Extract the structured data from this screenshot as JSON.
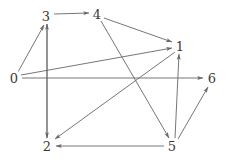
{
  "figure": {
    "kind": "directed-graph-diagram",
    "background_color": "#ffffff",
    "edge_color": "#666666",
    "label_color": "#3a3a3a",
    "edge_width": 0.9,
    "width": 226,
    "height": 160
  },
  "nodes": [
    {
      "id": "0",
      "label": "0",
      "x": 14,
      "y": 78
    },
    {
      "id": "1",
      "label": "1",
      "x": 180,
      "y": 46
    },
    {
      "id": "2",
      "label": "2",
      "x": 47,
      "y": 146
    },
    {
      "id": "3",
      "label": "3",
      "x": 46,
      "y": 16
    },
    {
      "id": "4",
      "label": "4",
      "x": 97,
      "y": 14
    },
    {
      "id": "5",
      "label": "5",
      "x": 172,
      "y": 146
    },
    {
      "id": "6",
      "label": "6",
      "x": 212,
      "y": 78
    }
  ],
  "edges": [
    {
      "from": "0",
      "to": "3",
      "directed": true,
      "x1": 18,
      "y1": 72,
      "x2": 44,
      "y2": 25
    },
    {
      "from": "0",
      "to": "1",
      "directed": true,
      "x1": 21,
      "y1": 75,
      "x2": 172,
      "y2": 48
    },
    {
      "from": "0",
      "to": "6",
      "directed": true,
      "x1": 22,
      "y1": 78,
      "x2": 203,
      "y2": 78
    },
    {
      "from": "3",
      "to": "4",
      "directed": true,
      "x1": 54,
      "y1": 14,
      "x2": 89,
      "y2": 13
    },
    {
      "from": "4",
      "to": "1",
      "directed": true,
      "x1": 104,
      "y1": 18,
      "x2": 172,
      "y2": 42
    },
    {
      "from": "4",
      "to": "5",
      "directed": true,
      "x1": 101,
      "y1": 21,
      "x2": 169,
      "y2": 138
    },
    {
      "from": "1",
      "to": "2",
      "directed": true,
      "x1": 175,
      "y1": 52,
      "x2": 55,
      "y2": 139
    },
    {
      "from": "2",
      "to": "3",
      "directed": true,
      "x1": 47,
      "y1": 138,
      "x2": 47,
      "y2": 24
    },
    {
      "from": "3",
      "to": "2",
      "directed": true,
      "x1": 47,
      "y1": 24,
      "x2": 47,
      "y2": 138
    },
    {
      "from": "5",
      "to": "1",
      "directed": true,
      "x1": 175,
      "y1": 138,
      "x2": 179,
      "y2": 54
    },
    {
      "from": "5",
      "to": "2",
      "directed": true,
      "x1": 164,
      "y1": 146,
      "x2": 56,
      "y2": 146
    },
    {
      "from": "5",
      "to": "6",
      "directed": true,
      "x1": 178,
      "y1": 139,
      "x2": 208,
      "y2": 87
    }
  ]
}
